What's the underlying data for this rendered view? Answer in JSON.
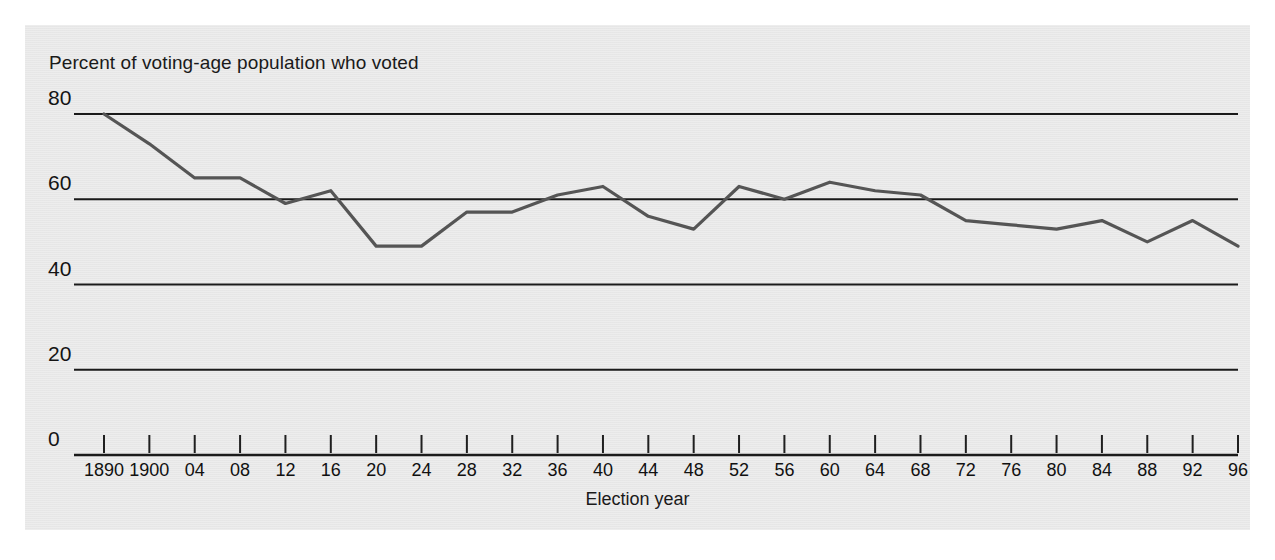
{
  "figure": {
    "background_color": "#ffffff",
    "panel_color": "#e9e9e9",
    "line_color": "#555555",
    "axis_color": "#1a1a1a"
  },
  "labels": {
    "y_axis_title": "Percent of voting-age population who voted",
    "x_axis_title": "Election year"
  },
  "chart_data": {
    "type": "line",
    "title": "",
    "subtitle": "",
    "ylabel": "Percent of voting-age population who voted",
    "xlabel": "Election year",
    "ylim": [
      0,
      88
    ],
    "yticks": [
      0,
      20,
      40,
      60,
      80
    ],
    "ytick_labels": [
      "0",
      "20",
      "40",
      "60",
      "80"
    ],
    "grid": true,
    "grid_axis": "y",
    "legend": false,
    "legend_position": "none",
    "x": [
      1890,
      1900,
      1904,
      1908,
      1912,
      1916,
      1920,
      1924,
      1928,
      1932,
      1936,
      1940,
      1944,
      1948,
      1952,
      1956,
      1960,
      1964,
      1968,
      1972,
      1976,
      1980,
      1984,
      1988,
      1992,
      1996
    ],
    "xtick_labels": [
      "1890",
      "1900",
      "04",
      "08",
      "12",
      "16",
      "20",
      "24",
      "28",
      "32",
      "36",
      "40",
      "44",
      "48",
      "52",
      "56",
      "60",
      "64",
      "68",
      "72",
      "76",
      "80",
      "84",
      "88",
      "92",
      "96"
    ],
    "categories": [
      "1890",
      "1900",
      "04",
      "08",
      "12",
      "16",
      "20",
      "24",
      "28",
      "32",
      "36",
      "40",
      "44",
      "48",
      "52",
      "56",
      "60",
      "64",
      "68",
      "72",
      "76",
      "80",
      "84",
      "88",
      "92",
      "96"
    ],
    "values": [
      80,
      73,
      65,
      65,
      59,
      62,
      49,
      49,
      57,
      57,
      61,
      63,
      56,
      53,
      63,
      60,
      64,
      62,
      61,
      55,
      54,
      53,
      55,
      50,
      55,
      49
    ],
    "series": [
      {
        "name": "Percent of voting-age population who voted",
        "values": [
          80,
          73,
          65,
          65,
          59,
          62,
          49,
          49,
          57,
          57,
          61,
          63,
          56,
          53,
          63,
          60,
          64,
          62,
          61,
          55,
          54,
          53,
          55,
          50,
          55,
          49
        ]
      }
    ],
    "annotations": []
  }
}
